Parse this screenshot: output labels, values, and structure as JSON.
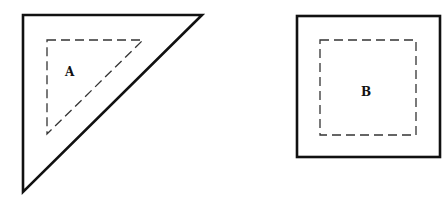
{
  "figure": {
    "shapes": [
      {
        "id": "A",
        "label": "A",
        "type": "right-triangle",
        "outer_border": "solid",
        "inner_border": "dashed"
      },
      {
        "id": "B",
        "label": "B",
        "type": "square",
        "outer_border": "solid",
        "inner_border": "dashed"
      }
    ],
    "colors": {
      "background": "#ffffff",
      "stroke": "#111111",
      "dash_stroke": "#333333"
    }
  }
}
